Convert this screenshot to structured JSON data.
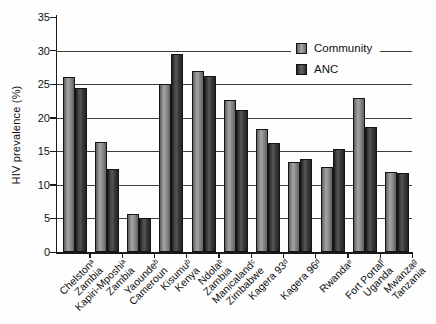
{
  "chart_data": {
    "type": "bar",
    "title": "",
    "xlabel": "",
    "ylabel": "HIV prevalence (%)",
    "ylim": [
      0,
      35
    ],
    "yticks": [
      0,
      5,
      10,
      15,
      20,
      25,
      30,
      35
    ],
    "gridlines_at": [
      5,
      10,
      15,
      20,
      25,
      30
    ],
    "grid": "horizontal",
    "legend_position": "top-right-inside",
    "categories": [
      {
        "lines": [
          "Chelstonᵃ",
          "Zambia"
        ]
      },
      {
        "lines": [
          "Kapiri-Mposhiᵃ",
          "Zambia"
        ]
      },
      {
        "lines": [
          "Yaoundeᵇ",
          "Cameroun"
        ]
      },
      {
        "lines": [
          "Kisumuᵇ",
          "Kenya"
        ]
      },
      {
        "lines": [
          "Ndolaᵇ",
          "Zambia"
        ]
      },
      {
        "lines": [
          "Manicalandᶜ",
          "Zimbabwe"
        ]
      },
      {
        "lines": [
          "Kagera 93ᵈ"
        ]
      },
      {
        "lines": [
          "Kagera 96ᵈ"
        ]
      },
      {
        "lines": [
          "Rwandaᵉ"
        ]
      },
      {
        "lines": [
          "Fort Portalᶠ",
          "Uganda"
        ]
      },
      {
        "lines": [
          "Mwanzaᵍ",
          "Tanzania"
        ]
      }
    ],
    "series": [
      {
        "name": "Community",
        "color": "#8f8f8f",
        "values": [
          26.0,
          16.4,
          5.6,
          25.0,
          26.9,
          22.6,
          18.3,
          13.4,
          12.7,
          23.0,
          11.9
        ]
      },
      {
        "name": "ANC",
        "color": "#3a3a3a",
        "values": [
          24.5,
          12.4,
          5.1,
          29.5,
          26.2,
          21.2,
          16.2,
          13.8,
          15.3,
          18.6,
          11.8
        ]
      }
    ],
    "axis_color": "#1a1a1a",
    "gridline_color": "#3d3d3d"
  }
}
